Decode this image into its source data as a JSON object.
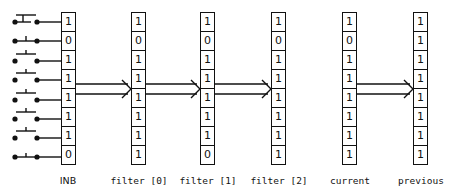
{
  "diagram": {
    "columns": [
      {
        "id": "inb",
        "label": "INB",
        "bits": [
          "1",
          "0",
          "1",
          "1",
          "1",
          "1",
          "1",
          "0"
        ]
      },
      {
        "id": "filter0",
        "label": "filter [0]",
        "bits": [
          "1",
          "0",
          "1",
          "1",
          "1",
          "1",
          "1",
          "1"
        ]
      },
      {
        "id": "filter1",
        "label": "filter [1]",
        "bits": [
          "1",
          "0",
          "1",
          "1",
          "1",
          "1",
          "1",
          "0"
        ]
      },
      {
        "id": "filter2",
        "label": "filter [2]",
        "bits": [
          "1",
          "0",
          "1",
          "1",
          "1",
          "1",
          "1",
          "1"
        ]
      },
      {
        "id": "current",
        "label": "current",
        "bits": [
          "1",
          "0",
          "1",
          "1",
          "1",
          "1",
          "1",
          "1"
        ]
      },
      {
        "id": "previous",
        "label": "previous",
        "bits": [
          "1",
          "1",
          "1",
          "1",
          "1",
          "1",
          "1",
          "1"
        ]
      }
    ],
    "switches": [
      {
        "state": "open"
      },
      {
        "state": "closed"
      },
      {
        "state": "open"
      },
      {
        "state": "open"
      },
      {
        "state": "open"
      },
      {
        "state": "open"
      },
      {
        "state": "open"
      },
      {
        "state": "closed"
      }
    ],
    "arrows": [
      {
        "from": "inb",
        "to": "filter0"
      },
      {
        "from": "filter0",
        "to": "filter1"
      },
      {
        "from": "filter1",
        "to": "filter2"
      },
      {
        "from": "current",
        "to": "previous"
      }
    ]
  }
}
